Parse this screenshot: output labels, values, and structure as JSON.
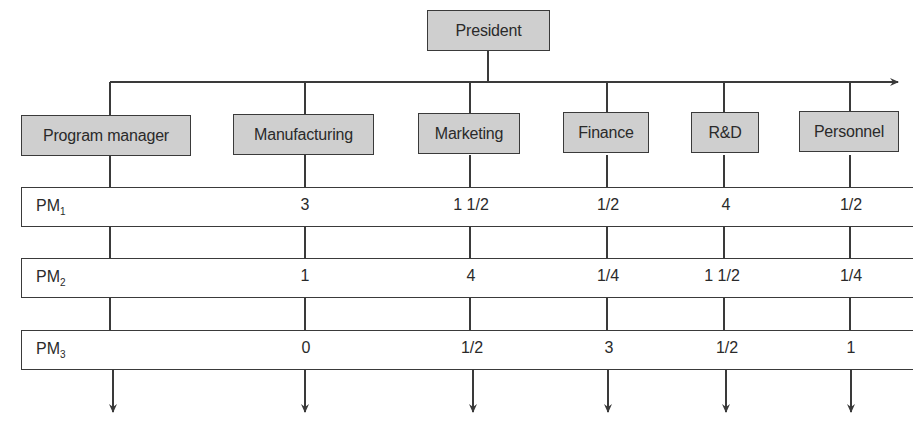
{
  "diagram": {
    "type": "matrix-organization-chart",
    "top": {
      "label": "President"
    },
    "departments": [
      {
        "label": "Program manager"
      },
      {
        "label": "Manufacturing"
      },
      {
        "label": "Marketing"
      },
      {
        "label": "Finance"
      },
      {
        "label": "R&D"
      },
      {
        "label": "Personnel"
      }
    ],
    "rows": [
      {
        "label": "PM",
        "sub": "1",
        "values": [
          "3",
          "1 1/2",
          "1/2",
          "4",
          "1/2"
        ]
      },
      {
        "label": "PM",
        "sub": "2",
        "values": [
          "1",
          "4",
          "1/4",
          "1 1/2",
          "1/4"
        ]
      },
      {
        "label": "PM",
        "sub": "3",
        "values": [
          "0",
          "1/2",
          "3",
          "1/2",
          "1"
        ]
      }
    ],
    "colors": {
      "box_fill": "#cfcfcf",
      "line": "#3a3a3a",
      "background": "#ffffff"
    }
  }
}
